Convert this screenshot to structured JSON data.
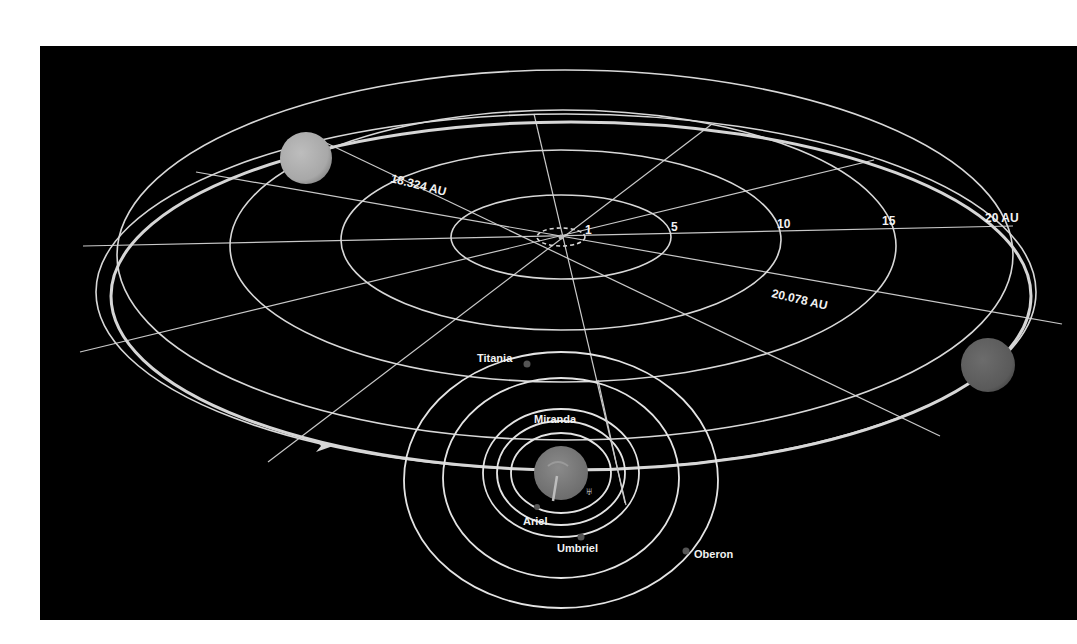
{
  "diagram": {
    "background_color": "#000000",
    "line_color": "#d8d8d8",
    "distance_labels": {
      "perihelion": "18.324 AU",
      "aphelion": "20.078 AU"
    },
    "scale_rings": [
      {
        "value": "1",
        "au": 1
      },
      {
        "value": "5",
        "au": 5
      },
      {
        "value": "10",
        "au": 10
      },
      {
        "value": "15",
        "au": 15
      },
      {
        "value": "20 AU",
        "au": 20
      }
    ],
    "planet": {
      "name": "Uranus",
      "symbol": "♅",
      "positions": [
        "perihelion-side (upper left)",
        "aphelion-side (right)",
        "current (bottom center)"
      ]
    },
    "moons": [
      {
        "name": "Miranda"
      },
      {
        "name": "Ariel"
      },
      {
        "name": "Umbriel"
      },
      {
        "name": "Titania"
      },
      {
        "name": "Oberon"
      }
    ],
    "direction_marker": "orbit-direction-arrow"
  }
}
